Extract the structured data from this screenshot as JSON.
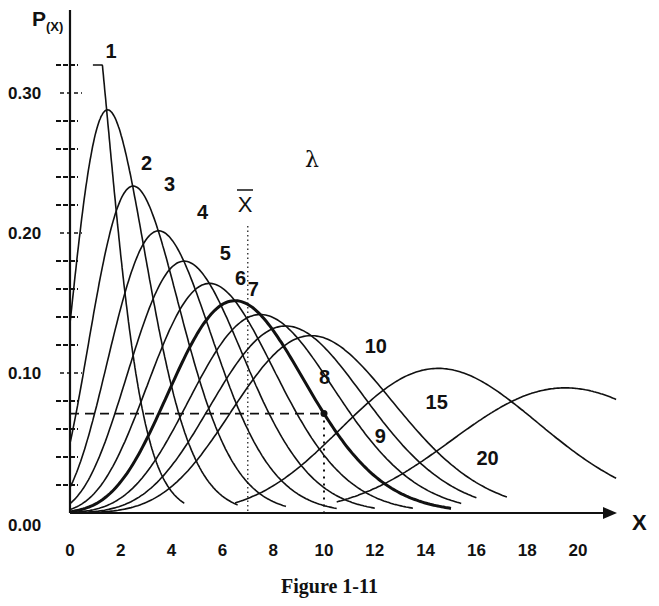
{
  "chart_data": {
    "type": "line",
    "title": "",
    "caption": "Figure 1-11",
    "xlabel": "X",
    "ylabel": "P(X)",
    "ylabel_main": "P",
    "ylabel_sub": "(X)",
    "parameter_label": "λ",
    "mean_label": "X",
    "xlim": [
      0,
      21
    ],
    "ylim": [
      0,
      0.34
    ],
    "x_ticks": [
      0,
      2,
      4,
      6,
      8,
      10,
      12,
      14,
      16,
      18,
      20
    ],
    "y_ticks": [
      {
        "value": 0.0,
        "label": "0.00"
      },
      {
        "value": 0.1,
        "label": "0.10"
      },
      {
        "value": 0.2,
        "label": "0.20"
      },
      {
        "value": 0.3,
        "label": "0.30"
      }
    ],
    "y_minor_ticks": [
      0.02,
      0.04,
      0.06,
      0.08,
      0.12,
      0.14,
      0.16,
      0.18,
      0.22,
      0.24,
      0.26,
      0.28,
      0.32
    ],
    "grid": false,
    "distribution": "Poisson",
    "series": [
      {
        "name": "1",
        "lambda": 1,
        "x_range": [
          0.9,
          4.5
        ],
        "peak": 0.32,
        "bold": false,
        "label_pos": [
          1.4,
          0.325
        ]
      },
      {
        "name": "2",
        "lambda": 2,
        "x_range": [
          0,
          6.6
        ],
        "peak": 0.271,
        "bold": false,
        "label_pos": [
          2.8,
          0.245
        ]
      },
      {
        "name": "3",
        "lambda": 3,
        "x_range": [
          0,
          8.5
        ],
        "peak": 0.224,
        "bold": false,
        "label_pos": [
          3.7,
          0.23
        ]
      },
      {
        "name": "4",
        "lambda": 4,
        "x_range": [
          0,
          10.5
        ],
        "peak": 0.195,
        "bold": false,
        "label_pos": [
          5.0,
          0.21
        ]
      },
      {
        "name": "5",
        "lambda": 5,
        "x_range": [
          0,
          12.0
        ],
        "peak": 0.175,
        "bold": false,
        "label_pos": [
          5.9,
          0.181
        ]
      },
      {
        "name": "6",
        "lambda": 6,
        "x_range": [
          0,
          13.5
        ],
        "peak": 0.161,
        "bold": false,
        "label_pos": [
          6.5,
          0.163
        ]
      },
      {
        "name": "7",
        "lambda": 7,
        "x_range": [
          0,
          15.0
        ],
        "peak": 0.149,
        "bold": true,
        "label_pos": [
          7.0,
          0.155
        ]
      },
      {
        "name": "8",
        "lambda": 8,
        "x_range": [
          0,
          15.4
        ],
        "peak": 0.14,
        "bold": false,
        "label_pos": [
          9.8,
          0.092
        ]
      },
      {
        "name": "9",
        "lambda": 9,
        "x_range": [
          0,
          16.0
        ],
        "peak": 0.132,
        "bold": false,
        "label_pos": [
          12.0,
          0.05
        ]
      },
      {
        "name": "10",
        "lambda": 10,
        "x_range": [
          0,
          17.2
        ],
        "peak": 0.125,
        "bold": false,
        "label_pos": [
          11.6,
          0.114
        ]
      },
      {
        "name": "15",
        "lambda": 15,
        "x_range": [
          6.5,
          21.5
        ],
        "peak": 0.102,
        "bold": false,
        "label_pos": [
          14.0,
          0.074
        ]
      },
      {
        "name": "20",
        "lambda": 20,
        "x_range": [
          10.5,
          21.5
        ],
        "peak": 0.089,
        "bold": false,
        "label_pos": [
          16.0,
          0.034
        ]
      }
    ],
    "annotations": {
      "mean_line": {
        "x": 7,
        "y_top": 0.205,
        "style": "dotted"
      },
      "reference_point": {
        "x": 10,
        "y": 0.071,
        "series": "7"
      },
      "horizontal_dashed": {
        "y": 0.071,
        "x_from": 0,
        "x_to": 10
      },
      "vertical_dotted": {
        "x": 10,
        "y_from": 0,
        "y_to": 0.071
      }
    }
  }
}
